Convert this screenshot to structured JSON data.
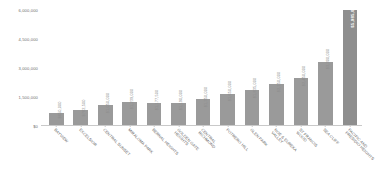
{
  "chart_data": {
    "type": "bar",
    "title": "",
    "subtitle": "",
    "xlabel": "",
    "ylabel": "",
    "grid": false,
    "legend": false,
    "ylim": [
      0,
      6000000
    ],
    "yticks": [
      "$0",
      "1,500,000",
      "3,000,000",
      "4,500,000",
      "6,000,000"
    ],
    "ytick_values": [
      0,
      1500000,
      3000000,
      4500000,
      6000000
    ],
    "categories": [
      "BAYVIEW",
      "EXCELSIOR",
      "CENTRAL SUNSET",
      "MIRALOMA PARK",
      "BERNAL HEIGHTS",
      "GOLDEN GATE HEIGHTS",
      "CENTRAL RICHMOND",
      "POTRERO HILL",
      "GLEN PARK",
      "NOE & EUREKA VALLEY",
      "ST FRANCIS WOOD",
      "SEA CLIFF",
      "PACIFIC AND PRESIDIO HEIGHTS"
    ],
    "category_lines": [
      [
        "BAYVIEW",
        ""
      ],
      [
        "EXCELSIOR",
        ""
      ],
      [
        "CENTRAL SUNSET",
        ""
      ],
      [
        "MIRALOMA PARK",
        ""
      ],
      [
        "BERNAL HEIGHTS",
        ""
      ],
      [
        "GOLDEN GATE",
        "HEIGHTS"
      ],
      [
        "CENTRAL",
        "RICHMOND"
      ],
      [
        "POTRERO HILL",
        ""
      ],
      [
        "GLEN PARK",
        ""
      ],
      [
        "NOE & EUREKA",
        "VALLEY"
      ],
      [
        "ST FRANCIS",
        "WOOD"
      ],
      [
        "SEA CLIFF",
        ""
      ],
      [
        "PACIFIC AND",
        "PRESIDIO HEIGHTS"
      ]
    ],
    "values": [
      650000,
      782500,
      1050000,
      1239000,
      1177500,
      1190000,
      1350000,
      1650000,
      1835000,
      2150000,
      2450000,
      3300000,
      5985000
    ],
    "value_labels": [
      "$650,000",
      "$782,500",
      "$1,050,000",
      "$1,239,000",
      "$1,177,500",
      "$1,190,000",
      "$1,350,000",
      "$1,650,000",
      "$1,835,000",
      "$2,150,000",
      "$2,450,000",
      "$3,300,000",
      "$5,985,000"
    ],
    "highlight_index": 12,
    "bar_color": "#9a9a9a",
    "highlight_color": "#8e8e8e",
    "label_color": "#8a8a8a",
    "axis_color": "#c9c9c9"
  }
}
